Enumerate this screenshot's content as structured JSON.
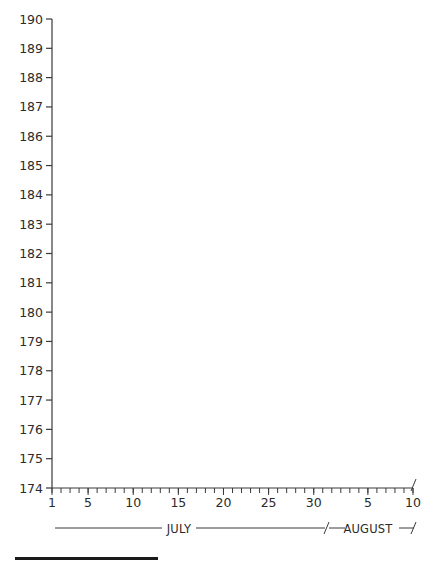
{
  "chart_data": {
    "type": "line",
    "title": "",
    "xlabel": "",
    "ylabel": "",
    "ylim": [
      174,
      190
    ],
    "yticks": [
      174,
      175,
      176,
      177,
      178,
      179,
      180,
      181,
      182,
      183,
      184,
      185,
      186,
      187,
      188,
      189,
      190
    ],
    "x_range": {
      "start": "July 1",
      "end": "August 10"
    },
    "x_tick_labels": [
      {
        "day_index": 0,
        "label": "1"
      },
      {
        "day_index": 4,
        "label": "5"
      },
      {
        "day_index": 9,
        "label": "10"
      },
      {
        "day_index": 14,
        "label": "15"
      },
      {
        "day_index": 19,
        "label": "20"
      },
      {
        "day_index": 24,
        "label": "25"
      },
      {
        "day_index": 29,
        "label": "30"
      },
      {
        "day_index": 35,
        "label": "5"
      },
      {
        "day_index": 40,
        "label": "10"
      }
    ],
    "months": [
      {
        "name": "JULY",
        "start_index": 0,
        "end_index": 30
      },
      {
        "name": "AUGUST",
        "start_index": 31,
        "end_index": 40
      }
    ],
    "series": [],
    "grid": false,
    "legend": null,
    "note": "Blank chart template — no data plotted"
  },
  "colors": {
    "axis": "#3a3a3a",
    "text": "#2b2b2b",
    "rule": "#1a1a1a",
    "background": "#ffffff"
  }
}
